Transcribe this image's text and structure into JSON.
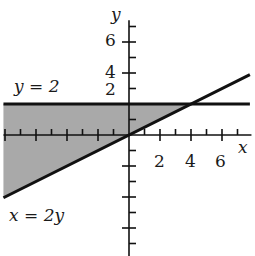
{
  "chart_data": {
    "type": "line",
    "title": "",
    "xlabel": "x",
    "ylabel": "y",
    "xlim": [
      -8.1,
      7.9
    ],
    "ylim": [
      -7.8,
      7.4
    ],
    "grid": false,
    "x_ticks": [
      -8,
      -7,
      -6,
      -5,
      -4,
      -3,
      -2,
      -1,
      1,
      2,
      3,
      4,
      5,
      6,
      7
    ],
    "x_tick_labels": [
      "2",
      "4",
      "6"
    ],
    "x_tick_label_values": [
      2,
      4,
      6
    ],
    "y_ticks": [
      -7,
      -6,
      -5,
      -4,
      -3,
      -2,
      -1,
      1,
      3,
      4,
      5,
      6,
      7
    ],
    "y_tick_labels": [
      {
        "text": "6",
        "value": 6
      },
      {
        "text": "4",
        "value": 4
      },
      {
        "text": "2",
        "value": 3
      }
    ],
    "series": [
      {
        "name": "y = 2",
        "equation": "y = 2",
        "x": [
          -8.1,
          7.8
        ],
        "y": [
          2,
          2
        ]
      },
      {
        "name": "x = 2y",
        "equation": "x = 2y",
        "x": [
          -8.1,
          7.8
        ],
        "y": [
          -4.05,
          3.9
        ]
      }
    ],
    "shaded_region": {
      "description": "region between y = 2 (above bound) and x = 2y (below bound), left of intersection (4, 2)",
      "vertices": [
        [
          -8.1,
          2
        ],
        [
          4,
          2
        ],
        [
          -8.1,
          -4.05
        ]
      ],
      "color": "#a9a9a9"
    },
    "annotations": [
      {
        "text": "y = 2",
        "near": [
          -6.5,
          3
        ]
      },
      {
        "text": "x = 2y",
        "near": [
          -6.5,
          -5
        ]
      }
    ]
  },
  "labels": {
    "x_axis": "x",
    "y_axis": "y",
    "eq_horizontal": "y = 2",
    "eq_diagonal": "x = 2y",
    "xt2": "2",
    "xt4": "4",
    "xt6": "6",
    "yt6": "6",
    "yt4": "4",
    "yt2": "2"
  },
  "colors": {
    "ink": "#111111",
    "shade": "#a9a9a9",
    "background": "#ffffff"
  }
}
